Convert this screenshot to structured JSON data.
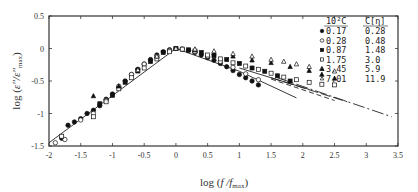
{
  "chart_data": {
    "type": "scatter",
    "title": "",
    "xlabel": "log (f /f_max)",
    "ylabel": "log (ε''/ε''_max)",
    "xlim": [
      -2,
      3.5
    ],
    "ylim": [
      -1.5,
      0.5
    ],
    "xticks": [
      -2,
      -1.5,
      -1,
      -0.5,
      0,
      0.5,
      1,
      1.5,
      2,
      2.5,
      3,
      3.5
    ],
    "yticks": [
      -1.5,
      -1,
      -0.5,
      0,
      0.5
    ],
    "grid": false,
    "legend": {
      "position": "upper right (inside)",
      "header": [
        "10²C",
        "C[η]"
      ],
      "entries": [
        {
          "marker": "filled-circle",
          "c": "0.17",
          "c_eta": "0.28"
        },
        {
          "marker": "open-circle",
          "c": "0.28",
          "c_eta": "0.48"
        },
        {
          "marker": "filled-square",
          "c": "0.87",
          "c_eta": "1.48"
        },
        {
          "marker": "open-square",
          "c": "1.75",
          "c_eta": "3.0"
        },
        {
          "marker": "filled-triangle",
          "c": "3.45",
          "c_eta": "5.9"
        },
        {
          "marker": "open-triangle",
          "c": "7.01",
          "c_eta": "11.9"
        }
      ]
    },
    "series": [
      {
        "name": "0.17",
        "marker": "filled-circle",
        "x": [
          -1.8,
          -1.7,
          -1.6,
          -1.5,
          -1.4,
          -1.3,
          -1.2,
          -1.1,
          -1.0,
          -0.9,
          -0.8,
          -0.7,
          -0.6,
          -0.5,
          -0.4,
          -0.3,
          -0.2,
          -0.1,
          0,
          0.1,
          0.2,
          0.3,
          0.4,
          0.5,
          0.6,
          0.7,
          0.8,
          0.9,
          1.0,
          1.1,
          1.2,
          1.3
        ],
        "y": [
          -1.38,
          -1.18,
          -1.13,
          -1.08,
          -1.0,
          -0.95,
          -0.88,
          -0.78,
          -0.7,
          -0.6,
          -0.5,
          -0.4,
          -0.32,
          -0.24,
          -0.17,
          -0.1,
          -0.05,
          -0.02,
          0,
          -0.01,
          -0.03,
          -0.06,
          -0.1,
          -0.14,
          -0.18,
          -0.23,
          -0.28,
          -0.34,
          -0.4,
          -0.45,
          -0.5,
          -0.56
        ]
      },
      {
        "name": "0.28",
        "marker": "open-circle",
        "x": [
          -1.9,
          -1.75,
          -1.5,
          -1.3,
          -1.1,
          -0.9,
          -0.7,
          -0.5,
          -0.3,
          -0.1,
          0.1,
          0.3,
          0.5,
          0.7,
          0.9,
          1.1,
          1.3
        ],
        "y": [
          -1.45,
          -1.4,
          -1.1,
          -1.0,
          -0.8,
          -0.58,
          -0.4,
          -0.24,
          -0.12,
          -0.03,
          -0.01,
          -0.05,
          -0.12,
          -0.2,
          -0.29,
          -0.39,
          -0.48
        ]
      },
      {
        "name": "0.87",
        "marker": "filled-square",
        "x": [
          -1.2,
          -1.0,
          -0.8,
          -0.6,
          -0.4,
          -0.2,
          0,
          0.2,
          0.4,
          0.6,
          0.8,
          1.0,
          1.2,
          1.4,
          1.6,
          1.8
        ],
        "y": [
          -0.85,
          -0.72,
          -0.52,
          -0.34,
          -0.2,
          -0.06,
          0,
          -0.02,
          -0.06,
          -0.11,
          -0.17,
          -0.23,
          -0.3,
          -0.35,
          -0.42,
          -0.5
        ]
      },
      {
        "name": "1.75",
        "marker": "open-square",
        "x": [
          -1.8,
          -1.3,
          -1.1,
          -0.9,
          -0.7,
          -0.5,
          -0.3,
          -0.1,
          0.1,
          0.3,
          0.5,
          0.7,
          0.9,
          1.1,
          1.3,
          1.5,
          1.7,
          1.9,
          2.1,
          2.3,
          2.5
        ],
        "y": [
          -1.35,
          -1.05,
          -0.82,
          -0.62,
          -0.45,
          -0.3,
          -0.16,
          -0.05,
          -0.01,
          -0.04,
          -0.1,
          -0.16,
          -0.22,
          -0.27,
          -0.32,
          -0.38,
          -0.44,
          -0.48,
          -0.52,
          -0.55,
          -0.56
        ]
      },
      {
        "name": "3.45",
        "marker": "filled-triangle",
        "x": [
          -1.3,
          -0.9,
          -0.6,
          -0.3,
          0,
          0.3,
          0.6,
          0.9,
          1.2,
          1.5,
          1.8,
          2.1,
          2.3,
          2.5
        ],
        "y": [
          -0.73,
          -0.58,
          -0.35,
          -0.12,
          0,
          -0.02,
          -0.07,
          -0.12,
          -0.18,
          -0.22,
          -0.28,
          -0.34,
          -0.4,
          -0.46
        ]
      },
      {
        "name": "7.01",
        "marker": "open-triangle",
        "x": [
          -0.6,
          -0.3,
          0,
          0.3,
          0.6,
          0.9,
          1.2,
          1.5,
          1.7,
          1.9,
          2.1,
          2.3,
          2.5
        ],
        "y": [
          -0.33,
          -0.12,
          0,
          -0.01,
          -0.04,
          -0.08,
          -0.12,
          -0.17,
          -0.2,
          -0.24,
          -0.28,
          -0.31,
          -0.35
        ]
      }
    ],
    "fit_lines": [
      {
        "style": "solid",
        "x": [
          -2.0,
          0.0,
          1.0,
          1.9
        ],
        "y": [
          -1.45,
          0.0,
          -0.35,
          -0.76
        ]
      },
      {
        "style": "solid",
        "x": [
          1.0,
          1.5,
          2.1
        ],
        "y": [
          -0.3,
          -0.45,
          -0.63
        ]
      },
      {
        "style": "dashed-short",
        "x": [
          1.5,
          2.5
        ],
        "y": [
          -0.47,
          -0.8
        ]
      },
      {
        "style": "dashed-long",
        "x": [
          1.5,
          2.7
        ],
        "y": [
          -0.45,
          -0.82
        ]
      },
      {
        "style": "dash-dot",
        "x": [
          1.6,
          3.4
        ],
        "y": [
          -0.45,
          -1.05
        ]
      }
    ]
  }
}
